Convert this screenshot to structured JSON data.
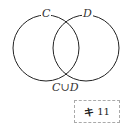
{
  "diagram": {
    "type": "venn",
    "sets": [
      {
        "label": "C",
        "cx": 46,
        "cy": 47,
        "r": 33
      },
      {
        "label": "D",
        "cx": 86,
        "cy": 47,
        "r": 33
      }
    ],
    "union_label": "C∪D",
    "stroke_color": "#222222"
  },
  "tag": {
    "mark": "キ",
    "number": "11"
  }
}
